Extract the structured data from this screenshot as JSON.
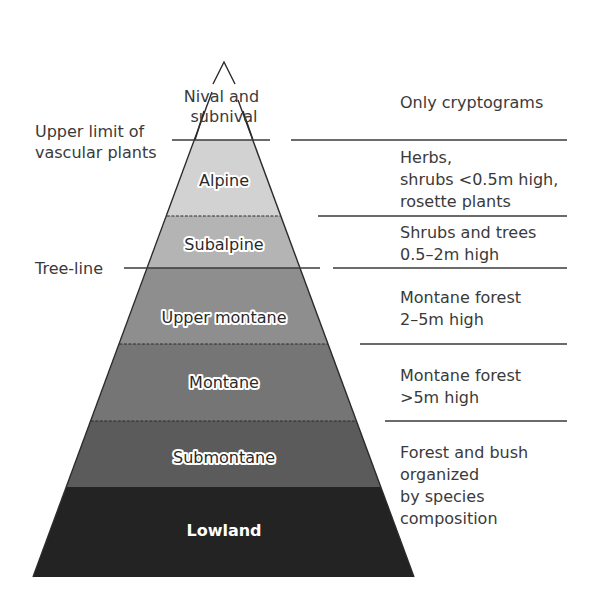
{
  "apex_labels": [
    "Nival and",
    "subnival"
  ],
  "left_labels": {
    "upper_limit": [
      "Upper limit of",
      "vascular plants"
    ],
    "tree_line": "Tree-line"
  },
  "zones": [
    {
      "name": "Alpine",
      "color": "#d2d2d2",
      "description": [
        "Herbs,",
        "shrubs <0.5m high,",
        "rosette plants"
      ]
    },
    {
      "name": "Subalpine",
      "color": "#b4b4b4",
      "description": [
        "Shrubs and trees",
        "0.5–2m high"
      ]
    },
    {
      "name": "Upper montane",
      "color": "#8e8e8e",
      "description": [
        "Montane forest",
        "2–5m high"
      ]
    },
    {
      "name": "Montane",
      "color": "#757575",
      "description": [
        "Montane forest",
        ">5m high"
      ]
    },
    {
      "name": "Submontane",
      "color": "#5b5b5b",
      "description": [
        "Forest and bush",
        "organized",
        "by species",
        "composition"
      ]
    },
    {
      "name": "Lowland",
      "color": "#232323",
      "description": []
    }
  ],
  "top_description": "Only cryptograms",
  "colors": {
    "text": "#3a3a3a",
    "background": "#ffffff",
    "lowland_text": "#ffffff"
  }
}
